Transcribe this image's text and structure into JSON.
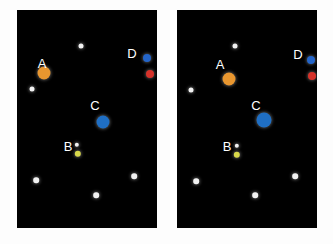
{
  "canvas": {
    "width": 333,
    "height": 244,
    "background": "#fdfdfd"
  },
  "colors": {
    "panel_background": "#000000",
    "star_white": "#f2f2f2",
    "orange": "#e8962f",
    "blue_large": "#1f6fc4",
    "blue_small": "#2465c9",
    "red": "#d6322a",
    "yellow": "#d8d84a",
    "label_text": "#ffffff"
  },
  "panels": [
    {
      "id": "left-panel",
      "name": "left-star-field",
      "x": 17,
      "y": 10,
      "width": 140,
      "height": 218,
      "labels": [
        {
          "text": "A",
          "x": 25,
          "y": 53
        },
        {
          "text": "D",
          "x": 115,
          "y": 43
        },
        {
          "text": "C",
          "x": 78,
          "y": 95
        },
        {
          "text": "B",
          "x": 51,
          "y": 136
        }
      ],
      "points": [
        {
          "name": "star-top",
          "x": 64,
          "y": 36,
          "r": 2.5,
          "color": "#f2f2f2",
          "glow": true
        },
        {
          "name": "point-a-orange",
          "x": 27,
          "y": 63,
          "r": 6.5,
          "color": "#e8962f",
          "glow": true
        },
        {
          "name": "point-d-blue",
          "x": 130,
          "y": 48,
          "r": 4.0,
          "color": "#2465c9",
          "glow": true
        },
        {
          "name": "point-d-red",
          "x": 133,
          "y": 64,
          "r": 4.0,
          "color": "#d6322a",
          "glow": true
        },
        {
          "name": "star-left",
          "x": 15,
          "y": 79,
          "r": 2.5,
          "color": "#f2f2f2",
          "glow": true
        },
        {
          "name": "point-c-blue",
          "x": 86,
          "y": 112,
          "r": 6.5,
          "color": "#1f6fc4",
          "glow": true
        },
        {
          "name": "star-near-b",
          "x": 60,
          "y": 135,
          "r": 2.2,
          "color": "#f2f2f2",
          "glow": true
        },
        {
          "name": "point-b-yellow",
          "x": 61,
          "y": 144,
          "r": 3.2,
          "color": "#d8d84a",
          "glow": true
        },
        {
          "name": "star-right-low",
          "x": 117,
          "y": 166,
          "r": 2.8,
          "color": "#f2f2f2",
          "glow": true
        },
        {
          "name": "star-left-low",
          "x": 19,
          "y": 170,
          "r": 2.8,
          "color": "#f2f2f2",
          "glow": true
        },
        {
          "name": "star-bottom",
          "x": 79,
          "y": 185,
          "r": 2.8,
          "color": "#f2f2f2",
          "glow": true
        }
      ]
    },
    {
      "id": "right-panel",
      "name": "right-star-field",
      "x": 177,
      "y": 10,
      "width": 140,
      "height": 218,
      "labels": [
        {
          "text": "A",
          "x": 43,
          "y": 54
        },
        {
          "text": "D",
          "x": 121,
          "y": 44
        },
        {
          "text": "C",
          "x": 79,
          "y": 95
        },
        {
          "text": "B",
          "x": 50,
          "y": 136
        }
      ],
      "points": [
        {
          "name": "star-top",
          "x": 58,
          "y": 36,
          "r": 2.5,
          "color": "#f2f2f2",
          "glow": true
        },
        {
          "name": "point-a-orange",
          "x": 52,
          "y": 69,
          "r": 6.5,
          "color": "#e8962f",
          "glow": true
        },
        {
          "name": "point-d-blue",
          "x": 134,
          "y": 50,
          "r": 4.0,
          "color": "#2465c9",
          "glow": true
        },
        {
          "name": "point-d-red",
          "x": 135,
          "y": 66,
          "r": 4.0,
          "color": "#d6322a",
          "glow": true
        },
        {
          "name": "star-left",
          "x": 14,
          "y": 80,
          "r": 2.5,
          "color": "#f2f2f2",
          "glow": true
        },
        {
          "name": "point-c-blue",
          "x": 87,
          "y": 110,
          "r": 7.5,
          "color": "#1f6fc4",
          "glow": true
        },
        {
          "name": "star-near-b",
          "x": 60,
          "y": 136,
          "r": 2.2,
          "color": "#f2f2f2",
          "glow": true
        },
        {
          "name": "point-b-yellow",
          "x": 60,
          "y": 145,
          "r": 3.2,
          "color": "#d8d84a",
          "glow": true
        },
        {
          "name": "star-right-low",
          "x": 118,
          "y": 166,
          "r": 2.8,
          "color": "#f2f2f2",
          "glow": true
        },
        {
          "name": "star-left-low",
          "x": 19,
          "y": 171,
          "r": 2.8,
          "color": "#f2f2f2",
          "glow": true
        },
        {
          "name": "star-bottom",
          "x": 78,
          "y": 185,
          "r": 2.8,
          "color": "#f2f2f2",
          "glow": true
        }
      ]
    }
  ]
}
